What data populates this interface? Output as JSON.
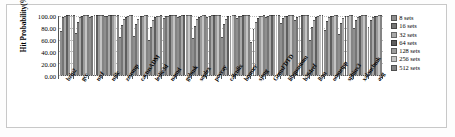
{
  "chart_data": {
    "type": "bar",
    "title": "",
    "xlabel": "",
    "ylabel": "Hit Probability(%)",
    "ylim": [
      0,
      100
    ],
    "ytick_labels": [
      "100.00",
      "80.00",
      "60.00",
      "40.00",
      "20.00",
      "0.00"
    ],
    "ytick_values": [
      100,
      80,
      60,
      40,
      20,
      0
    ],
    "grid": true,
    "legend_position": "right",
    "categories": [
      "bzip2",
      "gcc",
      "mcf",
      "milc",
      "zeusmp",
      "cactusADM",
      "leslie3d",
      "namd",
      "gobmk",
      "soplex",
      "povray",
      "calculix",
      "hmmer",
      "sjeng",
      "GemsFDTD",
      "libquantum",
      "h264ref",
      "lbm",
      "omnetpp",
      "sphinx3",
      "xalancbmk",
      "avg"
    ],
    "series": [
      {
        "name": "8 sets",
        "color": "#8f8f8f",
        "values": [
          73,
          69,
          97,
          98,
          62,
          65,
          58,
          95,
          97,
          61,
          97,
          63,
          95,
          54,
          96,
          86,
          92,
          57,
          74,
          67,
          78,
          79
        ]
      },
      {
        "name": "16 sets",
        "color": "#757575",
        "values": [
          96,
          88,
          99,
          99,
          83,
          84,
          79,
          98,
          99,
          82,
          99,
          85,
          98,
          76,
          99,
          95,
          97,
          80,
          90,
          87,
          92,
          91
        ]
      },
      {
        "name": "32 sets",
        "color": "#a8a8a8",
        "values": [
          99,
          96,
          100,
          100,
          93,
          94,
          91,
          99,
          100,
          93,
          100,
          94,
          99,
          89,
          100,
          98,
          99,
          92,
          96,
          95,
          97,
          96
        ]
      },
      {
        "name": "64 sets",
        "color": "#5e5e5e",
        "values": [
          100,
          99,
          100,
          100,
          97,
          98,
          96,
          100,
          100,
          97,
          100,
          98,
          100,
          95,
          100,
          99,
          100,
          97,
          98,
          98,
          99,
          98
        ]
      },
      {
        "name": "128 sets",
        "color": "#9b9b9b",
        "values": [
          100,
          100,
          100,
          100,
          99,
          99,
          98,
          100,
          100,
          99,
          100,
          99,
          100,
          98,
          100,
          100,
          100,
          99,
          99,
          99,
          100,
          99
        ]
      },
      {
        "name": "256 sets",
        "color": "#c4c4c4",
        "values": [
          100,
          100,
          100,
          100,
          100,
          100,
          99,
          100,
          100,
          100,
          100,
          100,
          100,
          99,
          100,
          100,
          100,
          100,
          100,
          100,
          100,
          100
        ]
      },
      {
        "name": "512 sets",
        "color": "#848484",
        "values": [
          100,
          100,
          100,
          100,
          100,
          100,
          100,
          100,
          100,
          100,
          100,
          100,
          100,
          100,
          100,
          100,
          100,
          100,
          100,
          100,
          100,
          100
        ]
      }
    ]
  },
  "legend": {
    "items": [
      {
        "label": "8 sets",
        "color": "#8f8f8f"
      },
      {
        "label": "16 sets",
        "color": "#757575"
      },
      {
        "label": "32 sets",
        "color": "#a8a8a8"
      },
      {
        "label": "64 sets",
        "color": "#5e5e5e"
      },
      {
        "label": "128 sets",
        "color": "#9b9b9b"
      },
      {
        "label": "256 sets",
        "color": "#c4c4c4"
      },
      {
        "label": "512 sets",
        "color": "#848484"
      }
    ]
  }
}
